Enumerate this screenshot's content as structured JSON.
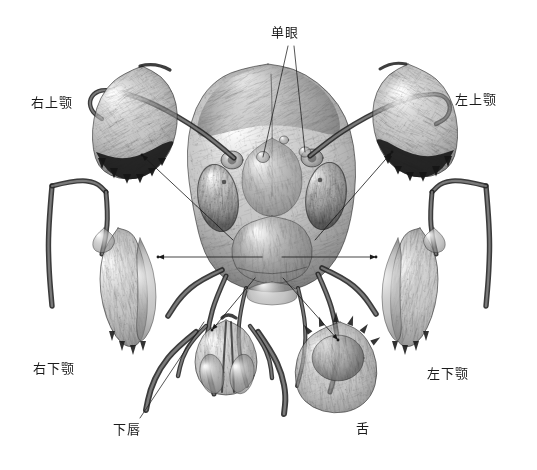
{
  "figure": {
    "kind": "scientific-illustration",
    "background_color": "#ffffff",
    "ink_color": "#1b1b1b",
    "width": 537,
    "height": 470
  },
  "labels": [
    {
      "id": "ocellus",
      "text": "单眼",
      "x": 271,
      "y": 26,
      "anchor": "top-center",
      "leaders": [
        {
          "from_x": 288,
          "from_y": 46,
          "to_x": 263,
          "to_y": 157
        },
        {
          "from_x": 294,
          "from_y": 46,
          "to_x": 305,
          "to_y": 152
        }
      ]
    },
    {
      "id": "right-mandible",
      "text": "右上颚",
      "x": 31,
      "y": 96,
      "anchor": "left",
      "leaders": []
    },
    {
      "id": "left-mandible",
      "text": "左上颚",
      "x": 455,
      "y": 93,
      "anchor": "right",
      "leaders": []
    },
    {
      "id": "right-maxilla",
      "text": "右下颚",
      "x": 33,
      "y": 362,
      "anchor": "left",
      "leaders": []
    },
    {
      "id": "left-maxilla",
      "text": "左下颚",
      "x": 427,
      "y": 367,
      "anchor": "right",
      "leaders": []
    },
    {
      "id": "labium",
      "text": "下唇",
      "x": 113,
      "y": 423,
      "anchor": "bottom-left",
      "leaders": [
        {
          "from_x": 140,
          "from_y": 418,
          "to_x": 204,
          "to_y": 322
        }
      ]
    },
    {
      "id": "tongue",
      "text": "舌",
      "x": 356,
      "y": 422,
      "anchor": "bottom-right",
      "leaders": []
    }
  ],
  "arrows": [
    {
      "id": "head-to-right-mandible",
      "from_x": 233,
      "from_y": 240,
      "to_x": 142,
      "to_y": 155,
      "head": "to"
    },
    {
      "id": "head-to-left-mandible",
      "from_x": 315,
      "from_y": 240,
      "to_x": 392,
      "to_y": 152,
      "head": "to"
    },
    {
      "id": "head-to-right-maxilla",
      "from_x": 262,
      "from_y": 257,
      "to_x": 158,
      "to_y": 257,
      "head": "to"
    },
    {
      "id": "head-to-left-maxilla",
      "from_x": 282,
      "from_y": 257,
      "to_x": 376,
      "to_y": 257,
      "head": "to"
    },
    {
      "id": "head-to-labium",
      "from_x": 255,
      "from_y": 278,
      "to_x": 212,
      "to_y": 330,
      "head": "to"
    },
    {
      "id": "head-to-tongue",
      "from_x": 283,
      "from_y": 278,
      "to_x": 338,
      "to_y": 340,
      "head": "to"
    }
  ],
  "structures": [
    {
      "id": "head-capsule",
      "name": "insect head capsule, frontal view"
    },
    {
      "id": "antenna-left",
      "name": "left antenna scape and flagellum"
    },
    {
      "id": "antenna-right",
      "name": "right antenna scape and flagellum"
    },
    {
      "id": "compound-eye-left",
      "name": "left compound eye"
    },
    {
      "id": "compound-eye-right",
      "name": "right compound eye"
    },
    {
      "id": "ocellus-left",
      "name": "left lateral ocellus"
    },
    {
      "id": "ocellus-right",
      "name": "right lateral ocellus"
    },
    {
      "id": "clypeus",
      "name": "clypeus"
    },
    {
      "id": "right-mandible-part",
      "name": "detached right mandible with toothed edge"
    },
    {
      "id": "left-mandible-part",
      "name": "detached left mandible with toothed edge"
    },
    {
      "id": "right-maxilla-part",
      "name": "detached right maxilla with galea and palp"
    },
    {
      "id": "left-maxilla-part",
      "name": "detached left maxilla with galea and palp"
    },
    {
      "id": "labium-part",
      "name": "detached labium with labial palps and paraglossae"
    },
    {
      "id": "tongue-part",
      "name": "detached hypopharynx / tongue"
    }
  ]
}
